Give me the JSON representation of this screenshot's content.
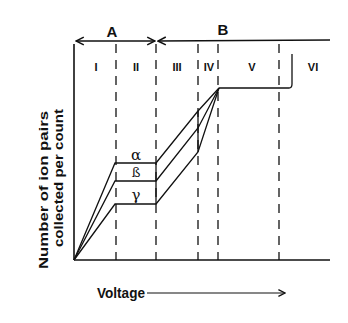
{
  "diagram": {
    "group_labels": [
      "A",
      "B"
    ],
    "regions": [
      "I",
      "II",
      "III",
      "IV",
      "V",
      "VI"
    ],
    "curves": [
      {
        "name": "alpha",
        "symbol": "α"
      },
      {
        "name": "beta",
        "symbol": "ß"
      },
      {
        "name": "gamma",
        "symbol": "γ"
      }
    ],
    "y_axis_label_line1": "Number of ion pairs",
    "y_axis_label_line2": "collected  per count",
    "x_axis_label": "Voltage",
    "colors": {
      "ink": "#111111",
      "background": "#ffffff"
    }
  }
}
